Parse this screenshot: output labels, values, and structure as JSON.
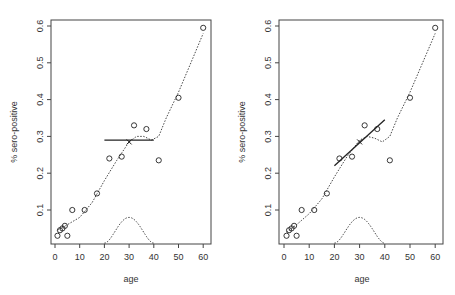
{
  "chart_data": [
    {
      "type": "scatter",
      "panel": "left",
      "title": "",
      "xlabel": "age",
      "ylabel": "% sero-positive",
      "xlim": [
        0,
        62
      ],
      "ylim": [
        0.01,
        0.615
      ],
      "x_ticks": [
        0,
        10,
        20,
        30,
        40,
        50,
        60
      ],
      "y_ticks": [
        0.1,
        0.2,
        0.3,
        0.4,
        0.5,
        0.6
      ],
      "grid": false,
      "points": [
        [
          1,
          0.03
        ],
        [
          2,
          0.045
        ],
        [
          3,
          0.05
        ],
        [
          4,
          0.057
        ],
        [
          5,
          0.03
        ],
        [
          7,
          0.1
        ],
        [
          12,
          0.1
        ],
        [
          17,
          0.145
        ],
        [
          22,
          0.24
        ],
        [
          27,
          0.245
        ],
        [
          32,
          0.33
        ],
        [
          37,
          0.32
        ],
        [
          42,
          0.235
        ],
        [
          50,
          0.405
        ],
        [
          60,
          0.595
        ]
      ],
      "smooth_curve": [
        [
          1,
          0.045
        ],
        [
          5,
          0.06
        ],
        [
          10,
          0.08
        ],
        [
          15,
          0.12
        ],
        [
          20,
          0.18
        ],
        [
          25,
          0.235
        ],
        [
          30,
          0.285
        ],
        [
          33,
          0.3
        ],
        [
          36,
          0.3
        ],
        [
          39,
          0.29
        ],
        [
          42,
          0.3
        ],
        [
          45,
          0.35
        ],
        [
          50,
          0.42
        ],
        [
          55,
          0.5
        ],
        [
          60,
          0.58
        ]
      ],
      "local_fit_line": {
        "x": [
          20,
          40
        ],
        "y": [
          0.29,
          0.29
        ],
        "label": "local constant fit"
      },
      "fit_point": {
        "x": 30,
        "y": 0.285,
        "marker": "x"
      },
      "kernel_curve": {
        "center": 30,
        "from": 20,
        "to": 40,
        "peak": 0.08
      },
      "kernel_baseline": 0.01
    },
    {
      "type": "scatter",
      "panel": "right",
      "title": "",
      "xlabel": "age",
      "ylabel": "% sero-positive",
      "xlim": [
        0,
        62
      ],
      "ylim": [
        0.01,
        0.615
      ],
      "x_ticks": [
        0,
        10,
        20,
        30,
        40,
        50,
        60
      ],
      "y_ticks": [
        0.1,
        0.2,
        0.3,
        0.4,
        0.5,
        0.6
      ],
      "grid": false,
      "points": [
        [
          1,
          0.03
        ],
        [
          2,
          0.045
        ],
        [
          3,
          0.05
        ],
        [
          4,
          0.057
        ],
        [
          5,
          0.03
        ],
        [
          7,
          0.1
        ],
        [
          12,
          0.1
        ],
        [
          17,
          0.145
        ],
        [
          22,
          0.24
        ],
        [
          27,
          0.245
        ],
        [
          32,
          0.33
        ],
        [
          37,
          0.32
        ],
        [
          42,
          0.235
        ],
        [
          50,
          0.405
        ],
        [
          60,
          0.595
        ]
      ],
      "smooth_curve": [
        [
          1,
          0.04
        ],
        [
          5,
          0.06
        ],
        [
          10,
          0.09
        ],
        [
          15,
          0.13
        ],
        [
          20,
          0.19
        ],
        [
          25,
          0.245
        ],
        [
          30,
          0.29
        ],
        [
          33,
          0.3
        ],
        [
          36,
          0.295
        ],
        [
          39,
          0.285
        ],
        [
          42,
          0.3
        ],
        [
          45,
          0.35
        ],
        [
          50,
          0.42
        ],
        [
          55,
          0.5
        ],
        [
          60,
          0.58
        ]
      ],
      "local_fit_line": {
        "x": [
          20,
          40
        ],
        "y": [
          0.22,
          0.345
        ],
        "label": "local linear fit"
      },
      "fit_point": {
        "x": 30,
        "y": 0.285,
        "marker": "x"
      },
      "kernel_curve": {
        "center": 30,
        "from": 20,
        "to": 40,
        "peak": 0.08
      },
      "kernel_baseline": 0.01
    }
  ],
  "panels": {
    "left": {
      "xlabel": "age",
      "ylabel": "% sero-positive"
    },
    "right": {
      "xlabel": "age",
      "ylabel": "% sero-positive"
    }
  },
  "layout": {
    "left": {
      "x0": 51,
      "x1": 211,
      "y0": 20,
      "y1": 244,
      "ax": 55,
      "ay": 26,
      "px_per_age": 2.47,
      "px_per_unit": 368
    },
    "right": {
      "x0": 279,
      "x1": 443,
      "y0": 20,
      "y1": 244,
      "ax": 284,
      "ay": 26,
      "px_per_age": 2.52,
      "px_per_unit": 368
    }
  },
  "colors": {
    "axis": "#444444",
    "points": "#222222",
    "curve": "#333333",
    "fit_line": "#222222"
  }
}
